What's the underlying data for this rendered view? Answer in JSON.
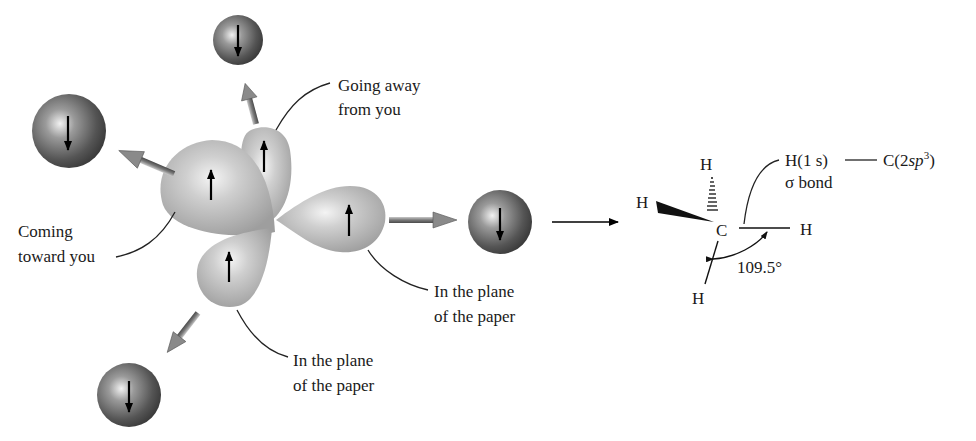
{
  "orbitals": {
    "hybrid_lobes": [
      {
        "id": "lobe-toward-you",
        "spin": "up",
        "direction": "coming toward you"
      },
      {
        "id": "lobe-away-from-you",
        "spin": "up",
        "direction": "going away from you"
      },
      {
        "id": "lobe-plane-right",
        "spin": "up",
        "direction": "in the plane of the paper"
      },
      {
        "id": "lobe-plane-bottom",
        "spin": "up",
        "direction": "in the plane of the paper"
      }
    ],
    "hydrogen_spheres": [
      {
        "id": "h-sphere-top",
        "spin": "down"
      },
      {
        "id": "h-sphere-left",
        "spin": "down"
      },
      {
        "id": "h-sphere-bottom",
        "spin": "down"
      },
      {
        "id": "h-sphere-right",
        "spin": "down"
      }
    ]
  },
  "labels": {
    "going_away_line1": "Going away",
    "going_away_line2": "from you",
    "coming_toward_line1": "Coming",
    "coming_toward_line2": "toward you",
    "plane_right_line1": "In the plane",
    "plane_right_line2": "of the paper",
    "plane_bottom_line1": "In the plane",
    "plane_bottom_line2": "of the paper"
  },
  "structure": {
    "central_atom": "C",
    "h_top": "H",
    "h_left": "H",
    "h_right": "H",
    "h_bottom": "H",
    "bond_angle": "109.5°",
    "bond_description_h": "H(1 s)",
    "bond_description_c_prefix": "C(2",
    "bond_description_c_italic": "sp",
    "bond_description_c_sup": "3",
    "bond_description_c_suffix": ")",
    "bond_type": "σ bond"
  },
  "colors": {
    "lobe_fill": "#b8b8b8",
    "sphere_dark": "#4a4a4a",
    "arrow_fill": "#8a8a8a",
    "text": "#1a1a1a"
  }
}
